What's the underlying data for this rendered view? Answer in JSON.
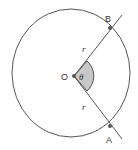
{
  "diagram": {
    "title": "",
    "labels": {
      "center": "O",
      "angle": "θ",
      "radius_upper": "r",
      "radius_lower": "r",
      "point_upper": "B",
      "point_lower": "A"
    },
    "colors": {
      "stroke": "#555555",
      "sector_fill": "#c8c8c8",
      "point": "#555555",
      "background": "#ffffff"
    }
  }
}
